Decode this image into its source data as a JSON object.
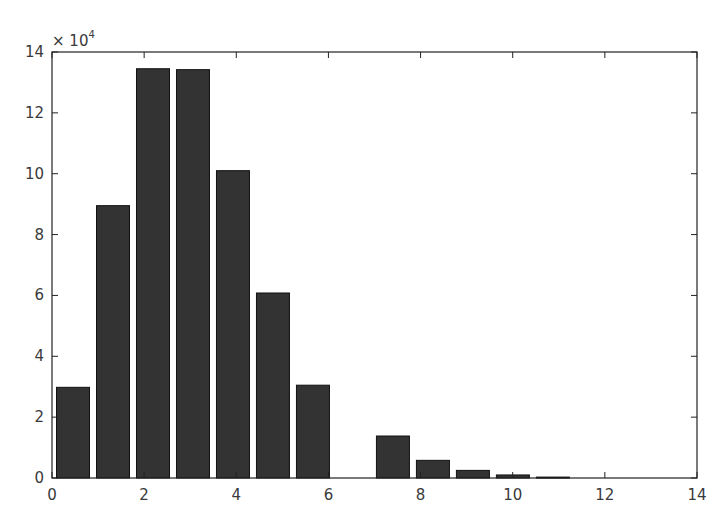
{
  "chart_data": {
    "type": "bar",
    "title": "",
    "xlabel": "",
    "ylabel": "",
    "y_multiplier": "× 10",
    "y_multiplier_exp": "4",
    "xlim": [
      0,
      14
    ],
    "ylim": [
      0,
      140000
    ],
    "x_ticks": [
      0,
      2,
      4,
      6,
      8,
      10,
      12,
      14
    ],
    "y_ticks": [
      0,
      2,
      4,
      6,
      8,
      10,
      12,
      14
    ],
    "grid": false,
    "legend": null,
    "bar_color": "#333333",
    "bar_edge_color": "#111111",
    "bar_width": 0.716,
    "x": [
      0.456,
      1.324,
      2.192,
      3.06,
      3.928,
      4.796,
      5.664,
      6.532,
      7.4,
      8.268,
      9.136,
      10.004,
      10.872
    ],
    "values": [
      29800,
      89500,
      134500,
      134200,
      101000,
      60800,
      30500,
      0,
      13800,
      5800,
      2500,
      1000,
      300
    ]
  }
}
